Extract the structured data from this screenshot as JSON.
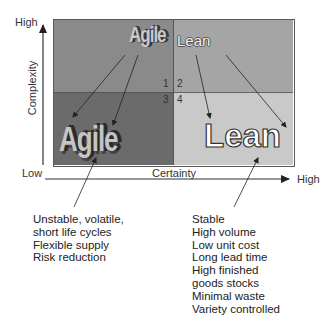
{
  "diagram": {
    "y_axis": {
      "label": "Complexity",
      "high": "High",
      "low": "Low"
    },
    "x_axis": {
      "label": "Certainty",
      "high": "High"
    },
    "quadrants": [
      {
        "number": "1",
        "label": "Agile",
        "color": "#8a8a8a"
      },
      {
        "number": "2",
        "label": "Lean",
        "color": "#a5a5a5"
      },
      {
        "number": "3",
        "label": "Agile",
        "color": "#6b6b6b"
      },
      {
        "number": "4",
        "label": "Lean",
        "color": "#c9c9c9"
      }
    ],
    "agile_description": [
      "Unstable, volatile,",
      "short life cycles",
      "Flexible supply",
      "Risk reduction"
    ],
    "lean_description": [
      "Stable",
      "High volume",
      "Low unit cost",
      "Long lead time",
      "High finished",
      "goods stocks",
      "Minimal waste",
      "Variety controlled"
    ]
  }
}
